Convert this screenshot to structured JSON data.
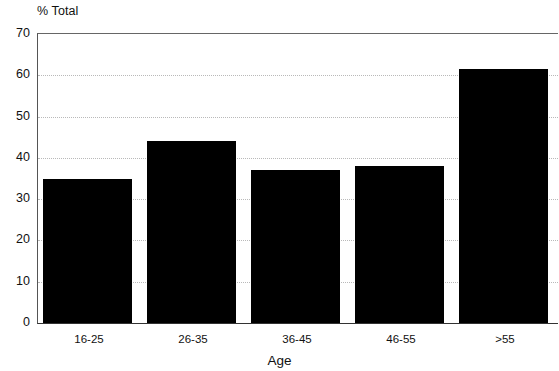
{
  "chart_data": {
    "type": "bar",
    "title": "",
    "xlabel": "Age",
    "ylabel": "% Total",
    "categories": [
      "16-25",
      "26-35",
      "36-45",
      "46-55",
      ">55"
    ],
    "values": [
      35,
      44,
      37,
      38,
      61.5
    ],
    "series": [
      {
        "name": "% Total",
        "values": [
          35,
          44,
          37,
          38,
          61.5
        ]
      }
    ],
    "ylim": [
      0,
      70
    ],
    "y_ticks": [
      70,
      60,
      50,
      40,
      30,
      20,
      10,
      0
    ],
    "y_tick_labels": [
      "70",
      "60",
      "50",
      "40",
      "30",
      "20",
      "10",
      "0"
    ],
    "grid": true,
    "grid_style": "dotted-horizontal",
    "legend": "none",
    "bar_color": "#000000",
    "grid_color": "#b9b9b9",
    "axis_color": "#333333",
    "background_color": "#ffffff"
  },
  "axes": {
    "y_title": "% Total",
    "x_title": "Age"
  }
}
